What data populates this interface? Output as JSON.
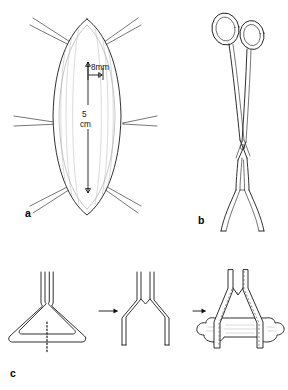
{
  "figure": {
    "background_color": "#ffffff",
    "ink_color": "#1a1a1a",
    "width": 288,
    "height": 390
  },
  "panels": [
    {
      "id": "a",
      "label": "a",
      "name": "panel-a-incision-with-retractors",
      "description": "Elliptical incision held open by six needle retractors with dimension annotations",
      "annotations": [
        {
          "name": "width-dimension",
          "text": "8mm",
          "kind": "horizontal-arrow"
        },
        {
          "name": "length-dimension-value",
          "text": "5",
          "kind": "vertical-double-arrow"
        },
        {
          "name": "length-dimension-unit",
          "text": "cm",
          "kind": "vertical-double-arrow"
        }
      ],
      "retractor_count": 6
    },
    {
      "id": "b",
      "label": "b",
      "name": "panel-b-ring-forceps",
      "description": "Ring-handled surgical forceps with crossed shanks and splayed V-shaped jaws",
      "parts": [
        {
          "name": "finger-ring-left"
        },
        {
          "name": "finger-ring-right"
        },
        {
          "name": "shank-crossing-hinge"
        },
        {
          "name": "splayed-jaws"
        }
      ]
    },
    {
      "id": "c",
      "label": "c",
      "name": "panel-c-wire-loop-sequence",
      "description": "Three-step sequence: triangular wire loop cut at the base, opened into a V, then applied around bone",
      "steps": [
        {
          "name": "step-1-triangular-loop",
          "caption": "",
          "annotations": [
            {
              "name": "cut-line",
              "text": "",
              "kind": "dotted-cut-line"
            }
          ]
        },
        {
          "name": "step-2-opened-v",
          "caption": ""
        },
        {
          "name": "step-3-applied-to-bone",
          "caption": ""
        }
      ],
      "arrows": [
        {
          "name": "sequence-arrow-1"
        },
        {
          "name": "sequence-arrow-2"
        }
      ]
    }
  ],
  "labels": {
    "panel_a": "a",
    "panel_b": "b",
    "panel_c": "c",
    "dim_width": "8mm",
    "dim_length_value": "5",
    "dim_length_unit": "cm"
  }
}
